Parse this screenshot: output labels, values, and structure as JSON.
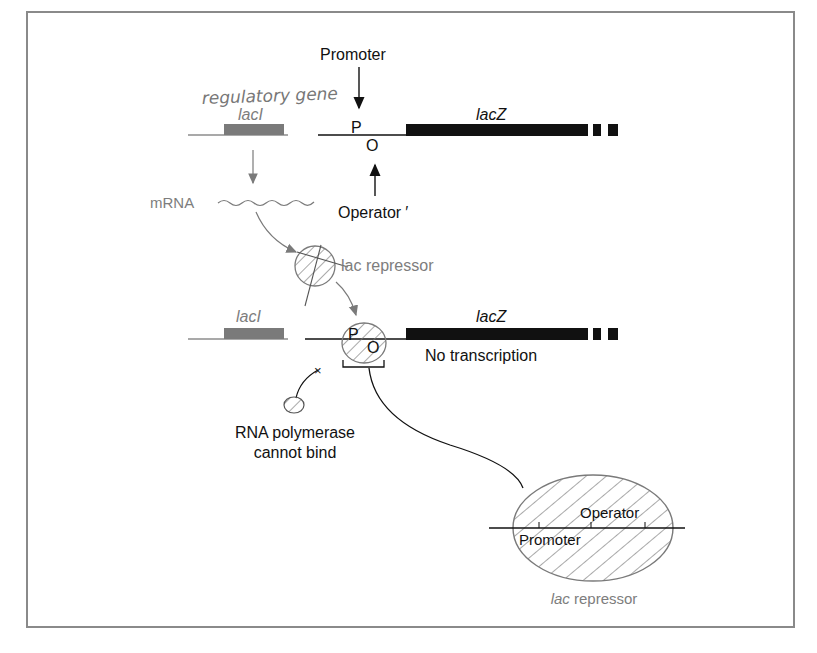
{
  "diagram": {
    "top_row": {
      "gene_laci_label": "lacI",
      "gene_lacz_label": "lacZ",
      "promoter_label": "Promoter",
      "promoter_letter": "P",
      "operator_letter": "O",
      "operator_label": "Operator",
      "operator_mark": "′",
      "handwritten_note": "regulatory gene"
    },
    "middle": {
      "mrna_label": "mRNA",
      "repressor_label": "lac repressor"
    },
    "bottom_row": {
      "gene_laci_label": "lacI",
      "gene_lacz_label": "lacZ",
      "promoter_letter": "P",
      "operator_letter": "O",
      "status_text": "No transcription"
    },
    "polymerase": {
      "line1": "RNA polymerase",
      "line2": "cannot bind"
    },
    "inset": {
      "operator_label": "Operator",
      "promoter_label": "Promoter",
      "repressor_italic": "lac",
      "repressor_rest": " repressor"
    },
    "colors": {
      "laci_gene": "#7a7a7a",
      "lacz_gene": "#111111",
      "gray_text": "#7d7d7d",
      "black_text": "#111111",
      "frame": "#8a8a8a",
      "hatch": "#7a7a7a"
    }
  }
}
